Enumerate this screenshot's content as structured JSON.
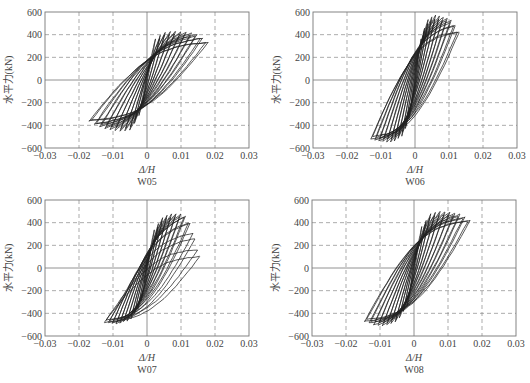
{
  "chart_data": [
    {
      "type": "line",
      "title": "W05",
      "xlabel": "Δ/H",
      "ylabel": "水平力(kN)",
      "xlim": [
        -0.03,
        0.03
      ],
      "ylim": [
        -600,
        600
      ],
      "xticks": [
        "-0.03",
        "-0.02",
        "-0.01",
        "0",
        "0.01",
        "0.02",
        "0.03"
      ],
      "yticks": [
        "600",
        "400",
        "200",
        "0",
        "-200",
        "-400",
        "-600"
      ],
      "grid": true,
      "peak_positive": {
        "drift": 0.014,
        "force": 430
      },
      "peak_negative": {
        "drift": -0.006,
        "force": -450
      },
      "max_drift_positive": 0.018,
      "max_drift_negative": -0.017,
      "envelope_positive": [
        [
          0.002,
          350
        ],
        [
          0.005,
          420
        ],
        [
          0.008,
          430
        ],
        [
          0.012,
          420
        ],
        [
          0.015,
          400
        ],
        [
          0.018,
          330
        ]
      ],
      "envelope_negative": [
        [
          -0.002,
          -300
        ],
        [
          -0.005,
          -440
        ],
        [
          -0.008,
          -450
        ],
        [
          -0.012,
          -430
        ],
        [
          -0.015,
          -400
        ],
        [
          -0.017,
          -360
        ]
      ]
    },
    {
      "type": "line",
      "title": "W06",
      "xlabel": "Δ/H",
      "ylabel": "水平力(kN)",
      "xlim": [
        -0.03,
        0.03
      ],
      "ylim": [
        -600,
        600
      ],
      "xticks": [
        "-0.03",
        "-0.02",
        "-0.01",
        "0",
        "0.01",
        "0.02",
        "0.03"
      ],
      "yticks": [
        "600",
        "400",
        "200",
        "0",
        "-200",
        "-400",
        "-600"
      ],
      "grid": true,
      "peak_positive": {
        "drift": 0.006,
        "force": 570
      },
      "peak_negative": {
        "drift": -0.008,
        "force": -550
      },
      "max_drift_positive": 0.013,
      "max_drift_negative": -0.013,
      "envelope_positive": [
        [
          0.002,
          400
        ],
        [
          0.004,
          540
        ],
        [
          0.006,
          570
        ],
        [
          0.009,
          550
        ],
        [
          0.011,
          520
        ],
        [
          0.013,
          420
        ]
      ],
      "envelope_negative": [
        [
          -0.002,
          -380
        ],
        [
          -0.004,
          -500
        ],
        [
          -0.007,
          -550
        ],
        [
          -0.01,
          -540
        ],
        [
          -0.013,
          -520
        ]
      ]
    },
    {
      "type": "line",
      "title": "W07",
      "xlabel": "Δ/H",
      "ylabel": "水平力(kN)",
      "xlim": [
        -0.03,
        0.03
      ],
      "ylim": [
        -600,
        600
      ],
      "xticks": [
        "-0.03",
        "-0.02",
        "-0.01",
        "0",
        "0.01",
        "0.02",
        "0.03"
      ],
      "yticks": [
        "600",
        "400",
        "200",
        "0",
        "-200",
        "-400",
        "-600"
      ],
      "grid": true,
      "peak_positive": {
        "drift": 0.01,
        "force": 480
      },
      "peak_negative": {
        "drift": -0.009,
        "force": -490
      },
      "max_drift_positive": 0.0155,
      "max_drift_negative": -0.0125,
      "envelope_positive": [
        [
          0.002,
          330
        ],
        [
          0.005,
          460
        ],
        [
          0.008,
          480
        ],
        [
          0.011,
          470
        ],
        [
          0.013,
          380
        ],
        [
          0.0155,
          100
        ]
      ],
      "envelope_negative": [
        [
          -0.002,
          -330
        ],
        [
          -0.005,
          -460
        ],
        [
          -0.009,
          -490
        ],
        [
          -0.0125,
          -480
        ]
      ]
    },
    {
      "type": "line",
      "title": "W08",
      "xlabel": "Δ/H",
      "ylabel": "水平力(kN)",
      "xlim": [
        -0.03,
        0.03
      ],
      "ylim": [
        -600,
        600
      ],
      "xticks": [
        "-0.03",
        "-0.02",
        "-0.01",
        "0",
        "0.01",
        "0.02",
        "0.03"
      ],
      "yticks": [
        "600",
        "400",
        "200",
        "0",
        "-200",
        "-400",
        "-600"
      ],
      "grid": true,
      "peak_positive": {
        "drift": 0.008,
        "force": 500
      },
      "peak_negative": {
        "drift": -0.009,
        "force": -510
      },
      "max_drift_positive": 0.0165,
      "max_drift_negative": -0.0145,
      "envelope_positive": [
        [
          0.002,
          350
        ],
        [
          0.005,
          480
        ],
        [
          0.008,
          500
        ],
        [
          0.011,
          490
        ],
        [
          0.014,
          470
        ],
        [
          0.0165,
          420
        ]
      ],
      "envelope_negative": [
        [
          -0.002,
          -330
        ],
        [
          -0.005,
          -470
        ],
        [
          -0.009,
          -510
        ],
        [
          -0.012,
          -500
        ],
        [
          -0.0145,
          -470
        ]
      ]
    }
  ],
  "panels": [
    {
      "id": "W05",
      "caption": "W05",
      "xlabel": "Δ/H",
      "ylabel": "水平力(kN)"
    },
    {
      "id": "W06",
      "caption": "W06",
      "xlabel": "Δ/H",
      "ylabel": "水平力(kN)"
    },
    {
      "id": "W07",
      "caption": "W07",
      "xlabel": "Δ/H",
      "ylabel": "水平力(kN)"
    },
    {
      "id": "W08",
      "caption": "W08",
      "xlabel": "Δ/H",
      "ylabel": "水平力(kN)"
    }
  ],
  "colors": {
    "curve": "#222222",
    "grid": "#888888",
    "axis": "#777777",
    "text": "#444444"
  }
}
